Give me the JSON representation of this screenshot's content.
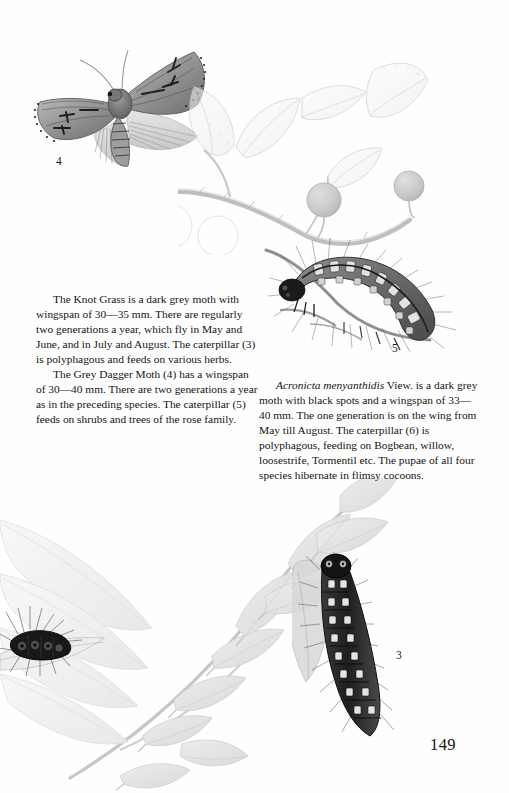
{
  "page": {
    "number": "149",
    "background_color": "#fefefe",
    "ink_color": "#141414"
  },
  "text_columns": {
    "left": {
      "paragraphs": [
        "The Knot Grass is a dark grey moth with wingspan of 30—35 mm. There are regularly two generations a year, which fly in May and June, and in July and August. The caterpillar (3) is polyphagous and feeds on various herbs.",
        "The Grey Dagger Moth (4) has a wingspan of 30—40 mm. There are two generations a year as in the preceding species. The caterpillar (5) feeds on shrubs and trees of the rose family."
      ]
    },
    "right": {
      "species_name": "Acronicta menyanthidis",
      "paragraph_rest": " View. is a dark grey moth with black spots and a wingspan of 33—40 mm. The one generation is on the wing from May till August. The caterpillar (6) is polyphagous, feeding on Bogbean, willow, loosestrife, Tormentil etc. The pupae of all four species hibernate in flimsy cocoons."
    }
  },
  "figure_labels": {
    "moth_grey_dagger": "4",
    "caterpillar_hairy_branch": "5",
    "caterpillar_dark_willow": "3"
  },
  "illustrations": [
    {
      "name": "grey-dagger-moth-illustration",
      "label": "4",
      "description": "Pencil illustration of a grey dagger moth with spread wings, top left"
    },
    {
      "name": "berry-branch-illustration",
      "label": "",
      "description": "Faint pencil branch with oval leaves and two round berries, top right"
    },
    {
      "name": "hairy-caterpillar-illustration",
      "label": "5",
      "description": "Hairy tufted caterpillar resting on a twig, centre right"
    },
    {
      "name": "willow-branch-illustration",
      "label": "",
      "description": "Willow branch with lanceolate leaves, lower half"
    },
    {
      "name": "dark-caterpillar-illustration",
      "label": "3",
      "description": "Dark banded hairy caterpillar climbing a willow stem, lower right"
    },
    {
      "name": "tufted-caterpillar-leaf-illustration",
      "label": "",
      "description": "Dark tufted caterpillar on a long narrow leaf, lower left edge"
    }
  ]
}
